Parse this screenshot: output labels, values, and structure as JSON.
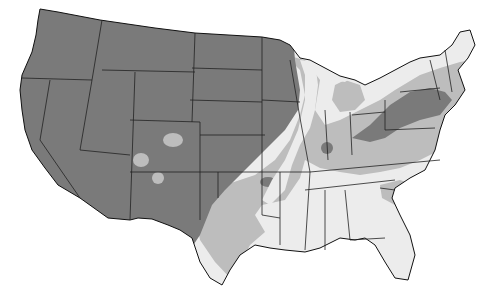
{
  "map": {
    "subject": "Contiguous United States shaded zone map",
    "background": "#ffffff",
    "zones": [
      {
        "id": "dark",
        "color": "#7a7a7a",
        "area": "West, Great Plains, Upper Midwest, Pennsylvania/New York"
      },
      {
        "id": "medium",
        "color": "#bdbdbd",
        "area": "Transition belt: Texas, Oklahoma, Missouri, Ohio Valley, Virginia, New England"
      },
      {
        "id": "light",
        "color": "#ececec",
        "area": "Deep South, Illinois corridor, Michigan, Maine, Florida"
      }
    ],
    "border_color": "#222222"
  }
}
